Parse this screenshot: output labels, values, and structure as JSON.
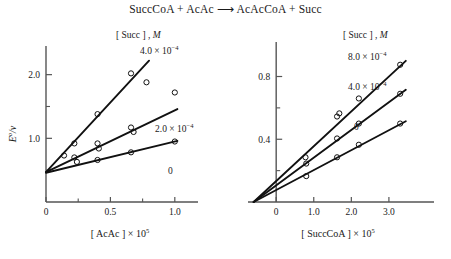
{
  "figure": {
    "reaction_title": "SuccCoA + AcAc ⟶ AcAcCoA + Succ"
  },
  "chart_data": [
    {
      "type": "line",
      "panel": "left",
      "title": "",
      "xlabel_text": "[ AcAc ] × 10",
      "xlabel_exponent": "5",
      "ylabel_main": "E",
      "ylabel_sup": "o",
      "ylabel_denom": "v",
      "xlim": [
        0,
        1.18
      ],
      "ylim": [
        0,
        2.45
      ],
      "xticks": [
        0,
        0.5,
        1.0
      ],
      "xtick_labels": [
        "0",
        "0.5",
        "1.0"
      ],
      "xminor_ticks": [
        0.25,
        0.75
      ],
      "yticks": [
        1.0,
        2.0
      ],
      "ytick_labels": [
        "1.0",
        "2.0"
      ],
      "yminor_ticks": [
        0.5,
        1.5
      ],
      "grid": false,
      "legend_title_bracket": "[ Succ ] ,",
      "legend_title_italic": "M",
      "legend_position": "upper-right",
      "series": [
        {
          "name": "4.0 × 10⁻⁴",
          "label_mantissa": "4.0 × 10",
          "label_exponent": "−4",
          "x": [
            0.0,
            0.14,
            0.22,
            0.4,
            0.66,
            0.78
          ],
          "y": [
            0.47,
            0.73,
            0.92,
            1.38,
            2.02,
            1.88
          ],
          "fit_x": [
            0.0,
            0.8
          ],
          "fit_y": [
            0.47,
            2.22
          ]
        },
        {
          "name": "2.0 × 10⁻⁴",
          "label_mantissa": "2.0 × 10",
          "label_exponent": "−4",
          "x": [
            0.0,
            0.22,
            0.24,
            0.4,
            0.41,
            0.66,
            0.68,
            1.0
          ],
          "y": [
            0.47,
            0.7,
            0.63,
            0.92,
            0.84,
            1.17,
            1.1,
            1.72
          ],
          "fit_x": [
            0.0,
            1.02
          ],
          "fit_y": [
            0.47,
            1.46
          ]
        },
        {
          "name": "0",
          "label_mantissa": "0",
          "label_exponent": "",
          "x": [
            0.0,
            0.4,
            0.66,
            1.0
          ],
          "y": [
            0.46,
            0.66,
            0.78,
            0.95
          ],
          "fit_x": [
            0.0,
            1.02
          ],
          "fit_y": [
            0.46,
            0.96
          ]
        }
      ]
    },
    {
      "type": "line",
      "panel": "right",
      "title": "",
      "xlabel_text": "[ SuccCoA ] × 10",
      "xlabel_exponent": "5",
      "xlim": [
        -0.75,
        4.2
      ],
      "ylim": [
        0,
        1.02
      ],
      "xticks": [
        0,
        1.0,
        2.0,
        3.0
      ],
      "xtick_labels": [
        "0",
        "1.0",
        "2.0",
        "3.0"
      ],
      "yticks": [
        0.4,
        0.8
      ],
      "ytick_labels": [
        "0.4",
        "0.8"
      ],
      "yminor_ticks": [
        0.2,
        0.6
      ],
      "grid": false,
      "x_intercept": -0.6,
      "legend_title_bracket": "[ Succ ] ,",
      "legend_title_italic": "M",
      "legend_position": "upper-right",
      "series": [
        {
          "name": "8.0 × 10⁻⁴",
          "label_mantissa": "8.0 × 10",
          "label_exponent": "−4",
          "x": [
            0.78,
            1.62,
            1.68,
            2.2,
            3.3
          ],
          "y": [
            0.285,
            0.545,
            0.565,
            0.66,
            0.875
          ],
          "fit_x": [
            -0.6,
            3.45
          ],
          "fit_y": [
            0.0,
            0.9
          ]
        },
        {
          "name": "4.0 × 10⁻⁴",
          "label_mantissa": "4.0 × 10",
          "label_exponent": "−4",
          "x": [
            0.8,
            1.62,
            2.2,
            3.3
          ],
          "y": [
            0.245,
            0.405,
            0.5,
            0.69
          ],
          "fit_x": [
            -0.6,
            3.45
          ],
          "fit_y": [
            0.0,
            0.715
          ]
        },
        {
          "name": "0",
          "label_mantissa": "0",
          "label_exponent": "",
          "x": [
            0.8,
            1.62,
            2.2,
            3.3
          ],
          "y": [
            0.165,
            0.285,
            0.365,
            0.5
          ],
          "fit_x": [
            -0.6,
            3.45
          ],
          "fit_y": [
            0.0,
            0.515
          ]
        }
      ]
    }
  ]
}
